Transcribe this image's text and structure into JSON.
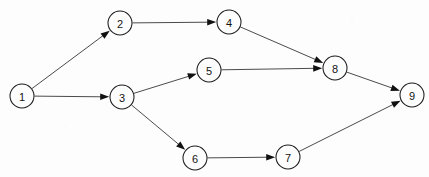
{
  "diagram": {
    "type": "directed-graph",
    "width": 429,
    "height": 177,
    "background_color": "#fdfdfd",
    "node_fill_color": "#fdfdfd",
    "node_stroke_color": "#1b1b1b",
    "edge_color": "#2a2a2a",
    "label_color": "#141414",
    "node_radius": 12,
    "nodes": [
      {
        "id": "1",
        "label": "1",
        "x": 22,
        "y": 96
      },
      {
        "id": "2",
        "label": "2",
        "x": 120,
        "y": 23
      },
      {
        "id": "3",
        "label": "3",
        "x": 122,
        "y": 97
      },
      {
        "id": "4",
        "label": "4",
        "x": 229,
        "y": 22
      },
      {
        "id": "5",
        "label": "5",
        "x": 209,
        "y": 70
      },
      {
        "id": "6",
        "label": "6",
        "x": 195,
        "y": 158
      },
      {
        "id": "7",
        "label": "7",
        "x": 288,
        "y": 157
      },
      {
        "id": "8",
        "label": "8",
        "x": 335,
        "y": 68
      },
      {
        "id": "9",
        "label": "9",
        "x": 412,
        "y": 95
      }
    ],
    "edges": [
      {
        "from": "1",
        "to": "2",
        "directed": true
      },
      {
        "from": "1",
        "to": "3",
        "directed": true
      },
      {
        "from": "2",
        "to": "4",
        "directed": true
      },
      {
        "from": "4",
        "to": "8",
        "directed": true
      },
      {
        "from": "3",
        "to": "5",
        "directed": true
      },
      {
        "from": "5",
        "to": "8",
        "directed": true
      },
      {
        "from": "3",
        "to": "6",
        "directed": true
      },
      {
        "from": "6",
        "to": "7",
        "directed": true
      },
      {
        "from": "7",
        "to": "9",
        "directed": true
      },
      {
        "from": "8",
        "to": "9",
        "directed": true
      }
    ]
  }
}
